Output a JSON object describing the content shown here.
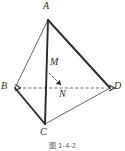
{
  "figure": {
    "caption": "图 1-4-2",
    "type": "tetrahedron-diagram",
    "background_color": "#ffffff",
    "stroke_color": "#2b2b2b",
    "dashed_color": "#555555",
    "label_color": "#2b2b2b",
    "vertices": [
      {
        "name": "A",
        "label": "A",
        "x": 48,
        "y": 20,
        "label_x": 44,
        "label_y": 2
      },
      {
        "name": "B",
        "label": "B",
        "x": 15,
        "y": 88,
        "label_x": 2,
        "label_y": 81
      },
      {
        "name": "C",
        "label": "C",
        "x": 45,
        "y": 124,
        "label_x": 40,
        "label_y": 128
      },
      {
        "name": "D",
        "label": "D",
        "x": 110,
        "y": 88,
        "label_x": 114,
        "label_y": 81
      }
    ],
    "points": [
      {
        "name": "M",
        "label": "M",
        "x": 47,
        "y": 73,
        "label_x": 50,
        "label_y": 57
      },
      {
        "name": "N",
        "label": "N",
        "x": 63,
        "y": 87,
        "label_x": 59,
        "label_y": 90
      }
    ],
    "edges": [
      {
        "name": "edge-AB",
        "from": "A",
        "to": "B",
        "style": "solid",
        "weight": "thin"
      },
      {
        "name": "edge-AC",
        "from": "A",
        "to": "C",
        "style": "solid",
        "weight": "thick"
      },
      {
        "name": "edge-AD",
        "from": "A",
        "to": "D",
        "style": "solid",
        "weight": "thick"
      },
      {
        "name": "edge-BC",
        "from": "B",
        "to": "C",
        "style": "solid",
        "weight": "thick"
      },
      {
        "name": "edge-CD",
        "from": "C",
        "to": "D",
        "style": "solid",
        "weight": "thin"
      },
      {
        "name": "edge-BD",
        "from": "B",
        "to": "D",
        "style": "dashed",
        "weight": "thin"
      }
    ],
    "arrows": [
      {
        "name": "arrow-BD-left",
        "at": "B",
        "direction": "left"
      },
      {
        "name": "arrow-BD-right",
        "at": "D",
        "direction": "right"
      },
      {
        "name": "arrow-MN",
        "from": "M",
        "to": "N",
        "style": "dashed"
      }
    ]
  }
}
